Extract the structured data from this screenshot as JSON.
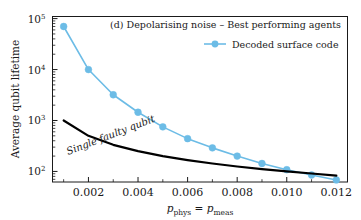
{
  "figure": {
    "panel_title": "(d) Depolarising noise – Best performing agents",
    "background_color": "#ffffff",
    "axes_color": "#1a1a1a"
  },
  "legend": {
    "position": "upper-right",
    "entries": [
      {
        "label": "Decoded surface code",
        "color": "#6cbce6",
        "marker": "circle"
      }
    ]
  },
  "annotations": [
    {
      "name": "single-faulty-qubit-label",
      "text": "Single faulty qubit",
      "color": "#000000"
    }
  ],
  "axis": {
    "x": {
      "label_main": "p",
      "label_sub1": "phys",
      "label_eq": " = ",
      "label_main2": "p",
      "label_sub2": "meas",
      "ticks": [
        "0.002",
        "0.004",
        "0.006",
        "0.008",
        "0.010",
        "0.012"
      ],
      "tick_values": [
        0.002,
        0.004,
        0.006,
        0.008,
        0.01,
        0.012
      ],
      "range": [
        0.00055,
        0.01245
      ]
    },
    "y": {
      "label": "Average qubit lifetime",
      "ticks": [
        "10",
        "10",
        "10",
        "10"
      ],
      "tick_exponents": [
        "5",
        "4",
        "3",
        "2"
      ],
      "tick_values": [
        100000,
        10000,
        1000,
        100
      ],
      "range": [
        62,
        110000
      ],
      "scale": "log"
    }
  },
  "chart_data": {
    "type": "line",
    "title": "(d) Depolarising noise – Best performing agents",
    "xlabel": "p_phys = p_meas",
    "ylabel": "Average qubit lifetime",
    "yscale": "log",
    "xlim": [
      0.00055,
      0.01245
    ],
    "ylim": [
      62,
      110000
    ],
    "grid": false,
    "legend_position": "upper right",
    "series": [
      {
        "name": "Decoded surface code",
        "color": "#6cbce6",
        "marker": "circle",
        "x": [
          0.001,
          0.002,
          0.003,
          0.004,
          0.005,
          0.006,
          0.007,
          0.008,
          0.009,
          0.01,
          0.011,
          0.012
        ],
        "y": [
          70000,
          10000,
          3200,
          1450,
          750,
          440,
          290,
          200,
          143,
          108,
          85,
          68
        ]
      },
      {
        "name": "Single faulty qubit",
        "color": "#000000",
        "marker": "none",
        "x": [
          0.001,
          0.002,
          0.003,
          0.004,
          0.005,
          0.006,
          0.007,
          0.008,
          0.009,
          0.01,
          0.011,
          0.012
        ],
        "y": [
          1000,
          500,
          333,
          250,
          200,
          167,
          143,
          125,
          111,
          100,
          91,
          83
        ]
      }
    ]
  }
}
